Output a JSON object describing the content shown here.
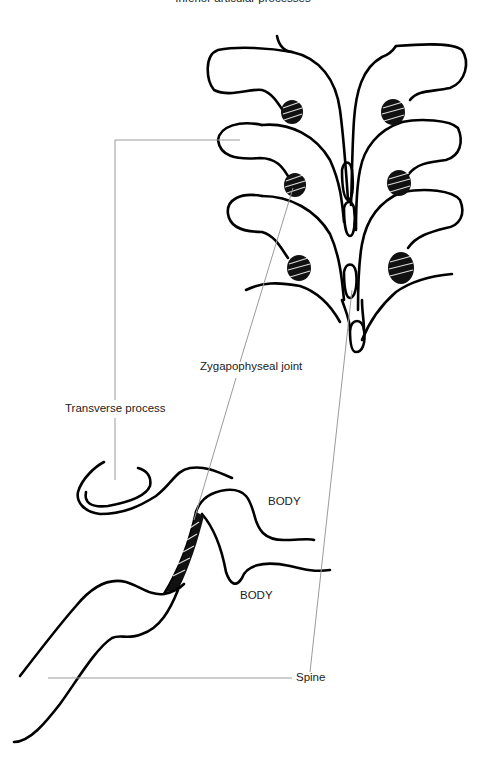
{
  "figure": {
    "top_caption": "Inferior articular processes",
    "labels": {
      "transverse_process": "Transverse process",
      "zygapophyseal_joint": "Zygapophyseal joint",
      "body_upper": "BODY",
      "body_lower": "BODY",
      "spine": "Spine"
    },
    "views": {
      "posterior": "posterior view of stacked vertebrae with hatched facet joints",
      "lateral": "lateral view showing two vertebral bodies and hatched joint"
    },
    "colors": {
      "ink": "#000000",
      "leader_line": "#9a9a9a",
      "background": "#ffffff"
    }
  }
}
